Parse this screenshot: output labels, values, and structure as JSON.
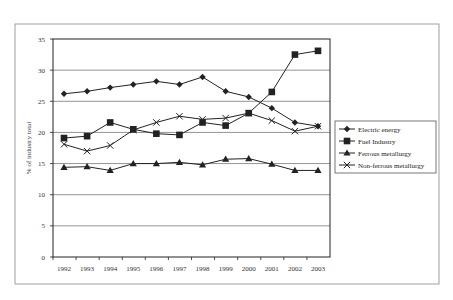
{
  "chart_data": {
    "type": "line",
    "title": "",
    "xlabel": "",
    "ylabel": "% of industry total",
    "x": [
      "1992",
      "1993",
      "1994",
      "1995",
      "1996",
      "1997",
      "1998",
      "1999",
      "2000",
      "2001",
      "2002",
      "2003"
    ],
    "ylim": [
      0,
      35
    ],
    "yticks": [
      "0",
      "5",
      "10",
      "15",
      "20",
      "25",
      "30",
      "35"
    ],
    "grid": true,
    "legend_position": "right",
    "series": [
      {
        "name": "Electric energy",
        "marker": "diamond",
        "values": [
          26.2,
          26.6,
          27.2,
          27.7,
          28.2,
          27.7,
          28.9,
          26.6,
          25.7,
          23.9,
          21.6,
          21.0
        ]
      },
      {
        "name": "Fuel Industry",
        "marker": "square",
        "values": [
          19.1,
          19.4,
          21.6,
          20.5,
          19.8,
          19.6,
          21.6,
          21.1,
          23.1,
          26.5,
          32.5,
          33.1
        ]
      },
      {
        "name": "Ferrous metallurgy",
        "marker": "triangle",
        "values": [
          14.4,
          14.5,
          13.9,
          15.0,
          15.0,
          15.2,
          14.8,
          15.7,
          15.8,
          14.9,
          13.9,
          13.9
        ]
      },
      {
        "name": "Non-ferrous metallurgy",
        "marker": "star-x",
        "values": [
          18.1,
          17.0,
          17.9,
          20.4,
          21.6,
          22.6,
          22.1,
          22.3,
          23.1,
          21.9,
          20.2,
          21.0
        ]
      }
    ]
  }
}
